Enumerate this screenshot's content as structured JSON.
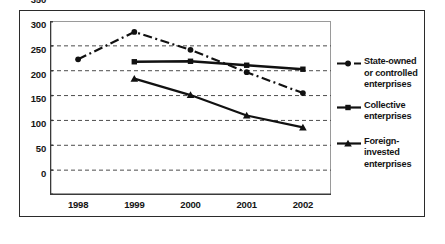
{
  "chart_data": {
    "type": "line",
    "title": "",
    "xlabel": "",
    "ylabel": "",
    "categories": [
      "1998",
      "1999",
      "2000",
      "2001",
      "2002"
    ],
    "ylim": [
      0,
      350
    ],
    "ytick_values": [
      0,
      50,
      100,
      150,
      200,
      250,
      300,
      350
    ],
    "ytick_labels": [
      "0",
      "50",
      "100",
      "150",
      "200",
      "250",
      "300",
      "350"
    ],
    "grid": "horizontal-dashed",
    "legend_position": "right",
    "series": [
      {
        "name": "State-owned or controlled enterprises",
        "legend_label_lines": [
          "State-owned",
          "or controlled",
          "enterprises"
        ],
        "linestyle": "dash-dot",
        "marker": "circle",
        "color": "#111111",
        "x": [
          "1998",
          "1999",
          "2000",
          "2001",
          "2002"
        ],
        "values": [
          273,
          328,
          292,
          247,
          205
        ]
      },
      {
        "name": "Collective enterprises",
        "legend_label_lines": [
          "Collective",
          "enterprises"
        ],
        "linestyle": "solid",
        "marker": "square",
        "color": "#111111",
        "x": [
          "1999",
          "2000",
          "2001",
          "2002"
        ],
        "values": [
          268,
          269,
          261,
          253
        ]
      },
      {
        "name": "Foreign-invested enterprises",
        "legend_label_lines": [
          "Foreign-",
          "invested",
          "enterprises"
        ],
        "linestyle": "solid",
        "marker": "triangle",
        "color": "#111111",
        "x": [
          "1999",
          "2000",
          "2001",
          "2002"
        ],
        "values": [
          234,
          201,
          160,
          136
        ]
      }
    ]
  },
  "axes": {
    "ytick_labels": [
      "350",
      "300",
      "250",
      "200",
      "150",
      "100",
      "50",
      "0"
    ],
    "xtick_labels": [
      "1998",
      "1999",
      "2000",
      "2001",
      "2002"
    ]
  },
  "legend": {
    "items": [
      {
        "id": "state-owned",
        "lines": [
          "State-owned",
          "or controlled",
          "enterprises"
        ]
      },
      {
        "id": "collective",
        "lines": [
          "Collective",
          "enterprises"
        ]
      },
      {
        "id": "foreign-invested",
        "lines": [
          "Foreign-",
          "invested",
          "enterprises"
        ]
      }
    ]
  },
  "colors": {
    "ink": "#111111",
    "frame": "#2b2b2b",
    "plot_border": "#9a9a9a",
    "grid": "#5a5a5a",
    "background": "#ffffff"
  }
}
